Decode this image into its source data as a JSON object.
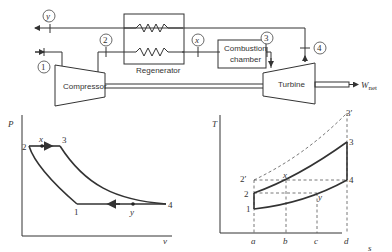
{
  "schematic": {
    "components": {
      "compressor": "Compressor",
      "regenerator": "Regenerator",
      "combustion_chamber_line1": "Combustion",
      "combustion_chamber_line2": "chamber",
      "turbine": "Turbine"
    },
    "state_points": [
      "1",
      "2",
      "x",
      "3",
      "4",
      "y"
    ],
    "work_output": {
      "symbol": "W",
      "subscript": "net"
    }
  },
  "pv_diagram": {
    "ylabel": "P",
    "xlabel": "v",
    "points": {
      "p1": "1",
      "p2": "2",
      "p3": "3",
      "p4": "4",
      "px": "x",
      "py": "y"
    }
  },
  "ts_diagram": {
    "ylabel": "T",
    "xlabel": "s",
    "points": {
      "p1": "1",
      "p2": "2",
      "p2p": "2′",
      "p3": "3",
      "p3p": "3′",
      "p4": "4",
      "px": "x",
      "py": "y"
    },
    "s_ticks": [
      "a",
      "b",
      "c",
      "d"
    ]
  }
}
